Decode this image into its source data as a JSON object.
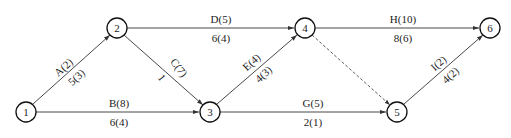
{
  "diagram": {
    "type": "activity-network",
    "nodes": [
      {
        "id": "1",
        "label": "1",
        "x": 26,
        "y": 112
      },
      {
        "id": "2",
        "label": "2",
        "x": 117,
        "y": 28
      },
      {
        "id": "3",
        "label": "3",
        "x": 210,
        "y": 112
      },
      {
        "id": "4",
        "label": "4",
        "x": 305,
        "y": 28
      },
      {
        "id": "5",
        "label": "5",
        "x": 397,
        "y": 112
      },
      {
        "id": "6",
        "label": "6",
        "x": 490,
        "y": 28
      }
    ],
    "edges": [
      {
        "id": "A",
        "from": "1",
        "to": "2",
        "top": "A(2)",
        "bottom": "5(3)",
        "dashed": false
      },
      {
        "id": "B",
        "from": "1",
        "to": "3",
        "top": "B(8)",
        "bottom": "6(4)",
        "dashed": false
      },
      {
        "id": "C",
        "from": "2",
        "to": "3",
        "top": "C(7)",
        "bottom": "1",
        "dashed": false
      },
      {
        "id": "D",
        "from": "2",
        "to": "4",
        "top": "D(5)",
        "bottom": "6(4)",
        "dashed": false
      },
      {
        "id": "E",
        "from": "3",
        "to": "4",
        "top": "E(4)",
        "bottom": "4(3)",
        "dashed": false
      },
      {
        "id": "G",
        "from": "3",
        "to": "5",
        "top": "G(5)",
        "bottom": "2(1)",
        "dashed": false
      },
      {
        "id": "H",
        "from": "4",
        "to": "6",
        "top": "H(10)",
        "bottom": "8(6)",
        "dashed": false
      },
      {
        "id": "dummy",
        "from": "4",
        "to": "5",
        "top": "",
        "bottom": "",
        "dashed": true
      },
      {
        "id": "I",
        "from": "5",
        "to": "6",
        "top": "I(2)",
        "bottom": "4(2)",
        "dashed": false
      }
    ]
  },
  "colors": {
    "line": "#333333",
    "node_stroke": "#111111",
    "background": "#ffffff"
  }
}
